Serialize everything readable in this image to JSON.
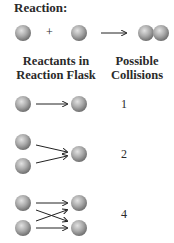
{
  "title": "Reaction:",
  "equation": {
    "plus": "+"
  },
  "headers": {
    "left": [
      "Reactants in",
      "Reaction Flask"
    ],
    "right": [
      "Possible",
      "Collisions"
    ]
  },
  "rows": [
    {
      "reactants_left": 1,
      "reactants_right": 1,
      "collisions": "1"
    },
    {
      "reactants_left": 2,
      "reactants_right": 1,
      "collisions": "2"
    },
    {
      "reactants_left": 2,
      "reactants_right": 2,
      "collisions": "4"
    }
  ],
  "colors": {
    "sphere_light": "#d9d9d9",
    "sphere_mid": "#a8a8a8",
    "sphere_dark": "#6f6f6f",
    "text": "#2a2a2a"
  }
}
